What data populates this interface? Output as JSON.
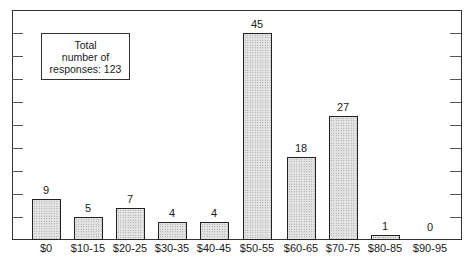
{
  "chart_data": {
    "type": "bar",
    "title": "",
    "xlabel": "",
    "ylabel": "",
    "categories": [
      "$0",
      "$10-15",
      "$20-25",
      "$30-35",
      "$40-45",
      "$50-55",
      "$60-65",
      "$70-75",
      "$80-85",
      "$90-95"
    ],
    "values": [
      9,
      5,
      7,
      4,
      4,
      45,
      18,
      27,
      1,
      0
    ],
    "ylim": [
      0,
      50
    ],
    "y_tick_step": 5,
    "y_tick_labels_shown": false,
    "grid": false,
    "data_labels": true,
    "annotation": {
      "line1": "Total",
      "line2": "number of",
      "line3": "responses: 123",
      "total": 123
    },
    "colors": {
      "bar_fill": "#e4e4e4",
      "bar_stipple": "#8a8a8a",
      "bar_border": "#222222",
      "axis": "#333333"
    }
  }
}
